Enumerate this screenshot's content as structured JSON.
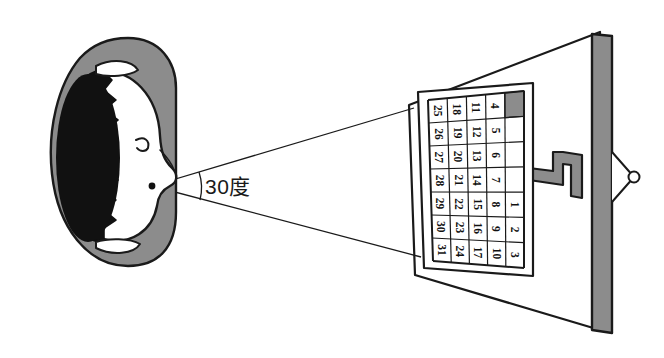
{
  "scene": {
    "title": "Top-down diagram of a person viewing a wall calendar at a 30 degree angle",
    "background_color": "#ffffff",
    "line_color": "#1a1a1a",
    "gray_fill": "#8c8c8c",
    "dark_fill": "#111111",
    "white_fill": "#ffffff"
  },
  "annotation": {
    "angle_label": "30度",
    "angle_value": "30",
    "angle_unit": "度"
  },
  "person": {
    "body_label": "shoulders",
    "hair_label": "hair",
    "face_label": "face-profile",
    "ear_top_label": "ear-top",
    "ear_bottom_label": "ear-bottom",
    "viewpoint_label": "eye-point"
  },
  "wall": {
    "label": "wall",
    "door_post_label": "door-post",
    "door_knob_label": "door-knob",
    "hook_label": "wall-hook"
  },
  "calendar": {
    "label": "wall-calendar",
    "highlight_cell_color": "#8c8c8c",
    "rows": 7,
    "columns": 5,
    "column_values": [
      [
        "25",
        "26",
        "27",
        "28",
        "29",
        "30",
        "31"
      ],
      [
        "18",
        "19",
        "20",
        "21",
        "22",
        "23",
        "24"
      ],
      [
        "11",
        "12",
        "13",
        "14",
        "15",
        "16",
        "17"
      ],
      [
        "4",
        "5",
        "6",
        "7",
        "8",
        "9",
        "10"
      ],
      [
        "",
        "",
        "",
        "",
        "1",
        "2",
        "3"
      ]
    ],
    "flat_values": [
      "25",
      "26",
      "27",
      "28",
      "29",
      "30",
      "31",
      "18",
      "19",
      "20",
      "21",
      "22",
      "23",
      "24",
      "11",
      "12",
      "13",
      "14",
      "15",
      "16",
      "17",
      "4",
      "5",
      "6",
      "7",
      "8",
      "9",
      "10",
      "",
      "",
      "",
      "",
      "1",
      "2",
      "3"
    ]
  },
  "sight_lines": {
    "upper_label": "sight-line-upper",
    "lower_label": "sight-line-lower"
  }
}
